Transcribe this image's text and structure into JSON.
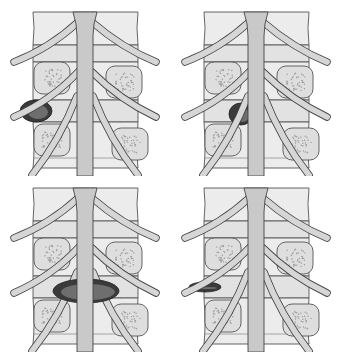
{
  "figure": {
    "colors": {
      "background": "#ffffff",
      "bone": "#ececec",
      "cord": "#c9c9c9",
      "herniation": "#3a3a3a",
      "outline": "#555555"
    },
    "panels": [
      {
        "id": "top-left",
        "herniation_type": "foraminal",
        "herniation": {
          "cx": 36,
          "cy": 111,
          "rx": 16,
          "ry": 11
        }
      },
      {
        "id": "top-right",
        "herniation_type": "posterolateral",
        "herniation": {
          "cx": 70,
          "cy": 114,
          "rx": 12,
          "ry": 11
        }
      },
      {
        "id": "bottom-left",
        "herniation_type": "central-bilateral",
        "herniation": {
          "cx": 86,
          "cy": 115,
          "rx": 33,
          "ry": 12
        }
      },
      {
        "id": "bottom-right",
        "herniation_type": "extraforaminal",
        "herniation": {
          "cx": 34,
          "cy": 111,
          "rx": 16,
          "ry": 5
        }
      }
    ]
  }
}
